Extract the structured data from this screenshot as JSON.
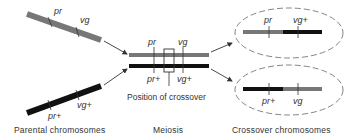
{
  "colors": {
    "grey_chromosome": "#777777",
    "black_chromosome": "#111111",
    "arrow": "#333333",
    "text": "#333333",
    "dashed": "#666666"
  },
  "genes": {
    "pr": "pr",
    "vg": "vg",
    "pr_plus": "pr+",
    "vg_plus": "vg+"
  },
  "parental": {
    "top": {
      "color": "grey",
      "labels": [
        "pr",
        "vg"
      ]
    },
    "bottom": {
      "color": "black",
      "labels": [
        "pr+",
        "vg+"
      ]
    },
    "caption": "Parental chromosomes"
  },
  "meiosis": {
    "top": {
      "color": "grey",
      "labels": [
        "pr",
        "vg"
      ]
    },
    "bottom": {
      "color": "black",
      "labels": [
        "pr+",
        "vg+"
      ]
    },
    "crossover_label": "Position of crossover",
    "caption": "Meiosis"
  },
  "crossover": {
    "top": {
      "segments": [
        "grey",
        "black"
      ],
      "labels": [
        "pr",
        "vg+"
      ]
    },
    "bottom": {
      "segments": [
        "black",
        "grey"
      ],
      "labels": [
        "pr+",
        "vg"
      ]
    },
    "caption": "Crossover chromosomes"
  }
}
